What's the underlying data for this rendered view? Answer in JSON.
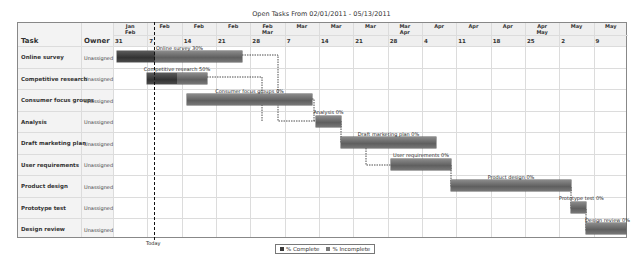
{
  "header": {
    "title": "Open Tasks From 02/01/2011 - 05/13/2011"
  },
  "columns": {
    "task": "Task",
    "owner": "Owner"
  },
  "weeks": [
    {
      "month": "Jan\nFeb",
      "day": "31"
    },
    {
      "month": "Feb",
      "day": "7"
    },
    {
      "month": "Feb",
      "day": "14"
    },
    {
      "month": "Feb",
      "day": "21"
    },
    {
      "month": "Feb\nMar",
      "day": "28"
    },
    {
      "month": "Mar",
      "day": "7"
    },
    {
      "month": "Mar",
      "day": "14"
    },
    {
      "month": "Mar",
      "day": "21"
    },
    {
      "month": "Mar\nApr",
      "day": "28"
    },
    {
      "month": "Apr",
      "day": "4"
    },
    {
      "month": "Apr",
      "day": "11"
    },
    {
      "month": "Apr",
      "day": "18"
    },
    {
      "month": "Apr\nMay",
      "day": "25"
    },
    {
      "month": "May",
      "day": "2"
    },
    {
      "month": "May",
      "day": "9"
    }
  ],
  "tasks": [
    {
      "name": "Online survey",
      "owner": "Unassigned",
      "label": "Online survey 30%"
    },
    {
      "name": "Competitive research",
      "owner": "Unassigned",
      "label": "Competitive research 50%"
    },
    {
      "name": "Consumer focus groups",
      "owner": "Unassigned",
      "label": "Consumer focus groups 0%"
    },
    {
      "name": "Analysis",
      "owner": "Unassigned",
      "label": "Analysis 0%"
    },
    {
      "name": "Draft marketing plan",
      "owner": "Unassigned",
      "label": "Draft marketing plan 0%"
    },
    {
      "name": "User requirements",
      "owner": "Unassigned",
      "label": "User requirements 0%"
    },
    {
      "name": "Product design",
      "owner": "Unassigned",
      "label": "Product design 0%"
    },
    {
      "name": "Prototype test",
      "owner": "Unassigned",
      "label": "Prototype test 0%"
    },
    {
      "name": "Design review",
      "owner": "Unassigned",
      "label": "Design review 0%"
    }
  ],
  "today_label": "Today",
  "legend": {
    "complete": "% Complete",
    "incomplete": "% Incomplete",
    "complete_color": "#3a3a3a",
    "incomplete_color": "#7a7a7a"
  },
  "chart_data": {
    "type": "gantt",
    "title": "Open Tasks From 02/01/2011 - 05/13/2011",
    "x_axis": {
      "unit": "week",
      "week_starts": [
        "Jan 31",
        "Feb 7",
        "Feb 14",
        "Feb 21",
        "Feb 28",
        "Mar 7",
        "Mar 14",
        "Mar 21",
        "Mar 28",
        "Apr 4",
        "Apr 11",
        "Apr 18",
        "Apr 25",
        "May 2",
        "May 9"
      ]
    },
    "today": "~Feb 10, 2011",
    "tasks": [
      {
        "task": "Online survey",
        "owner": "Unassigned",
        "start": "2011-02-01",
        "end": "2011-02-26",
        "percent_complete": 30
      },
      {
        "task": "Competitive research",
        "owner": "Unassigned",
        "start": "2011-02-07",
        "end": "2011-02-19",
        "percent_complete": 50
      },
      {
        "task": "Consumer focus groups",
        "owner": "Unassigned",
        "start": "2011-02-15",
        "end": "2011-03-12",
        "percent_complete": 0
      },
      {
        "task": "Analysis",
        "owner": "Unassigned",
        "start": "2011-03-13",
        "end": "2011-03-18",
        "percent_complete": 0
      },
      {
        "task": "Draft marketing plan",
        "owner": "Unassigned",
        "start": "2011-03-18",
        "end": "2011-04-06",
        "percent_complete": 0
      },
      {
        "task": "User requirements",
        "owner": "Unassigned",
        "start": "2011-03-28",
        "end": "2011-04-09",
        "percent_complete": 0
      },
      {
        "task": "Product design",
        "owner": "Unassigned",
        "start": "2011-04-09",
        "end": "2011-05-03",
        "percent_complete": 0
      },
      {
        "task": "Prototype test",
        "owner": "Unassigned",
        "start": "2011-05-03",
        "end": "2011-05-06",
        "percent_complete": 0
      },
      {
        "task": "Design review",
        "owner": "Unassigned",
        "start": "2011-05-06",
        "end": "2011-05-13",
        "percent_complete": 0
      }
    ],
    "dependencies": [
      [
        "Online survey",
        "Analysis"
      ],
      [
        "Competitive research",
        "Analysis"
      ],
      [
        "Consumer focus groups",
        "Analysis"
      ],
      [
        "Analysis",
        "Draft marketing plan"
      ],
      [
        "Draft marketing plan",
        "User requirements"
      ],
      [
        "User requirements",
        "Product design"
      ],
      [
        "Product design",
        "Prototype test"
      ],
      [
        "Prototype test",
        "Design review"
      ]
    ],
    "legend": [
      "% Complete",
      "% Incomplete"
    ],
    "legend_position": "bottom"
  }
}
